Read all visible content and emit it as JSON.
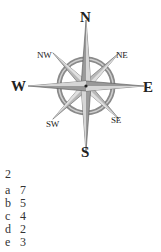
{
  "compass": {
    "labels": {
      "n": "N",
      "s": "S",
      "e": "E",
      "w": "W",
      "ne": "NE",
      "nw": "NW",
      "se": "SE",
      "sw": "SW"
    },
    "colors": {
      "ring": "#8a8a8a",
      "point_dark": "#6e6e6e",
      "point_light": "#d8d8d8"
    }
  },
  "question_number": "2",
  "answers": [
    {
      "key": "a",
      "value": "7"
    },
    {
      "key": "b",
      "value": "5"
    },
    {
      "key": "c",
      "value": "4"
    },
    {
      "key": "d",
      "value": "2"
    },
    {
      "key": "e",
      "value": "3"
    }
  ]
}
